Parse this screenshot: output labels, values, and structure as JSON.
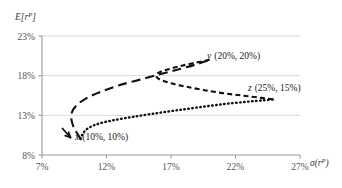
{
  "chart_data": {
    "type": "line",
    "title": "",
    "subtitle": "",
    "xlabel": "σ(rᵖ)",
    "xlabel_base": "σ(r",
    "xlabel_sup": "P",
    "xlabel_close": ")",
    "ylabel": "E[rᵖ]",
    "ylabel_base": "E[r",
    "ylabel_sup": "P",
    "ylabel_close": "]",
    "xlim": [
      7,
      27
    ],
    "ylim": [
      8,
      23
    ],
    "xticks": [
      "7%",
      "12%",
      "17%",
      "22%",
      "27%"
    ],
    "xtick_values": [
      7,
      12,
      17,
      22,
      27
    ],
    "yticks": [
      "23%",
      "18%",
      "13%",
      "8%"
    ],
    "ytick_values": [
      23,
      18,
      13,
      8
    ],
    "grid": "horizontal",
    "legend_position": "inline-annotations",
    "assets": [
      {
        "key": "x",
        "label": "x (10%, 10%)",
        "name_italic": "x",
        "coords_text": "(10%, 10%)",
        "sigma": 10,
        "expected_return": 10
      },
      {
        "key": "y",
        "label": "y (20%, 20%)",
        "name_italic": "y",
        "coords_text": "(20%, 20%)",
        "sigma": 20,
        "expected_return": 20
      },
      {
        "key": "z",
        "label": "z (25%, 15%)",
        "name_italic": "z",
        "coords_text": "(25%, 15%)",
        "sigma": 25,
        "expected_return": 15
      }
    ],
    "series": [
      {
        "name": "x-y frontier",
        "style": "long-dash",
        "points": [
          [
            10.0,
            10.0
          ],
          [
            9.55,
            11.2
          ],
          [
            9.3,
            12.3
          ],
          [
            9.3,
            13.3
          ],
          [
            9.7,
            14.3
          ],
          [
            10.5,
            15.2
          ],
          [
            11.6,
            16.0
          ],
          [
            13.0,
            16.8
          ],
          [
            14.6,
            17.5
          ],
          [
            16.2,
            18.2
          ],
          [
            17.6,
            18.8
          ],
          [
            18.9,
            19.4
          ],
          [
            20.0,
            20.0
          ]
        ]
      },
      {
        "name": "y-z frontier",
        "style": "short-dash",
        "points": [
          [
            20.0,
            20.0
          ],
          [
            18.8,
            19.6
          ],
          [
            17.7,
            19.2
          ],
          [
            16.8,
            18.8
          ],
          [
            16.2,
            18.5
          ],
          [
            15.9,
            18.2
          ],
          [
            15.9,
            17.8
          ],
          [
            16.3,
            17.4
          ],
          [
            17.1,
            17.0
          ],
          [
            18.2,
            16.6
          ],
          [
            19.5,
            16.2
          ],
          [
            21.0,
            15.8
          ],
          [
            22.5,
            15.5
          ],
          [
            24.0,
            15.2
          ],
          [
            25.0,
            15.0
          ]
        ]
      },
      {
        "name": "x-z frontier",
        "style": "dotted",
        "points": [
          [
            10.0,
            10.0
          ],
          [
            10.2,
            10.8
          ],
          [
            10.7,
            11.5
          ],
          [
            11.5,
            12.0
          ],
          [
            12.6,
            12.4
          ],
          [
            14.0,
            12.8
          ],
          [
            15.6,
            13.2
          ],
          [
            17.3,
            13.6
          ],
          [
            19.1,
            14.0
          ],
          [
            21.0,
            14.4
          ],
          [
            22.8,
            14.7
          ],
          [
            24.2,
            14.9
          ],
          [
            25.0,
            15.0
          ]
        ]
      }
    ]
  }
}
